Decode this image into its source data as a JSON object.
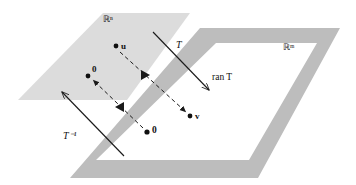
{
  "figure": {
    "background_color": "#ffffff",
    "domain_plane": {
      "name": "domain-plane",
      "label": "ℝⁿ",
      "label_plain": "R^n",
      "fill_color": "#dcdcdc",
      "points": [
        {
          "name": "u",
          "label": "u",
          "x": 116,
          "y": 46
        },
        {
          "name": "zero-domain",
          "label": "0",
          "x": 88,
          "y": 74
        }
      ]
    },
    "codomain_plane": {
      "name": "codomain-plane",
      "label": "ℝᵐ",
      "label_plain": "R^m",
      "fill_color": "#bdbdbd",
      "interior_color": "#ffffff",
      "range_label": "ran T",
      "points": [
        {
          "name": "v",
          "label": "v",
          "x": 192,
          "y": 115
        },
        {
          "name": "zero-codomain",
          "label": "0",
          "x": 148,
          "y": 133
        }
      ]
    },
    "arrows": {
      "forward": {
        "name": "forward-transform-arrow",
        "label": "T",
        "label_x": 176,
        "label_y": 48,
        "stroke_color": "#1a1a1a"
      },
      "inverse": {
        "name": "inverse-transform-arrow",
        "label": "T⁻¹",
        "label_plain": "T^-1",
        "label_x": 72,
        "label_y": 136,
        "stroke_color": "#1a1a1a"
      },
      "map_u_to_v": {
        "name": "dashed-arrow-u-to-v",
        "style": "dashed"
      },
      "map_zero_to_zero": {
        "name": "dashed-arrow-zero-to-zero",
        "style": "dashed"
      }
    },
    "range_annotation": {
      "name": "ran-t-label",
      "text": "ran T",
      "x": 212,
      "y": 77
    }
  }
}
